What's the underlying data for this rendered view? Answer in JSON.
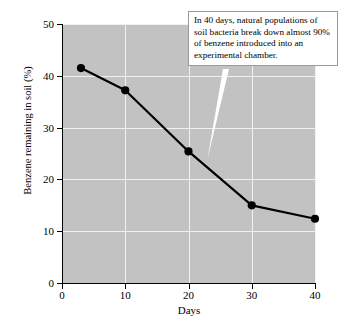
{
  "chart_data": {
    "type": "line",
    "title": "",
    "xlabel": "Days",
    "ylabel": "Benzene remaining in soil (%)",
    "xlim": [
      0,
      40
    ],
    "ylim": [
      0,
      50
    ],
    "xticks": [
      "0",
      "10",
      "20",
      "30",
      "40"
    ],
    "yticks": [
      "0",
      "10",
      "20",
      "30",
      "40",
      "50"
    ],
    "xtick_values": [
      0,
      10,
      20,
      30,
      40
    ],
    "ytick_values": [
      0,
      10,
      20,
      30,
      40,
      50
    ],
    "grid": true,
    "legend": null,
    "series": [
      {
        "name": "Benzene remaining in soil",
        "x": [
          3,
          10,
          20,
          30,
          40
        ],
        "values": [
          41.5,
          37.2,
          25.4,
          15.0,
          12.4
        ],
        "color": "#000000",
        "marker": "circle"
      }
    ],
    "annotations": [
      {
        "name": "callout",
        "text": "In 40 days, natural populations of soil bacteria break down almost 90% of benzene introduced into an experimental chamber.",
        "points_to_x": 23,
        "points_to_y": 24
      }
    ],
    "plot_background": "#c2c2c2",
    "gridline_color": "#f2f2f2"
  }
}
